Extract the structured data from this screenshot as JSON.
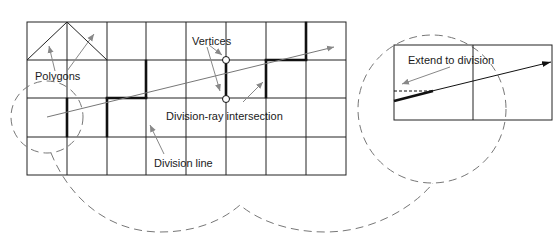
{
  "labels": {
    "polygons": "Polygons",
    "vertices": "Vertices",
    "division_ray_intersection": "Division-ray intersection",
    "division_line": "Division line",
    "extend_to_division": "Extend to division"
  },
  "colors": {
    "grid": "#222222",
    "bold_edges": "#111111",
    "ray": "#777777",
    "pointer_arrows": "#888888",
    "dashed_callouts": "#777777",
    "background": "#ffffff"
  },
  "main_grid": {
    "columns": 8,
    "rows": 4
  },
  "inset_grid": {
    "columns": 2,
    "rows": 1
  }
}
